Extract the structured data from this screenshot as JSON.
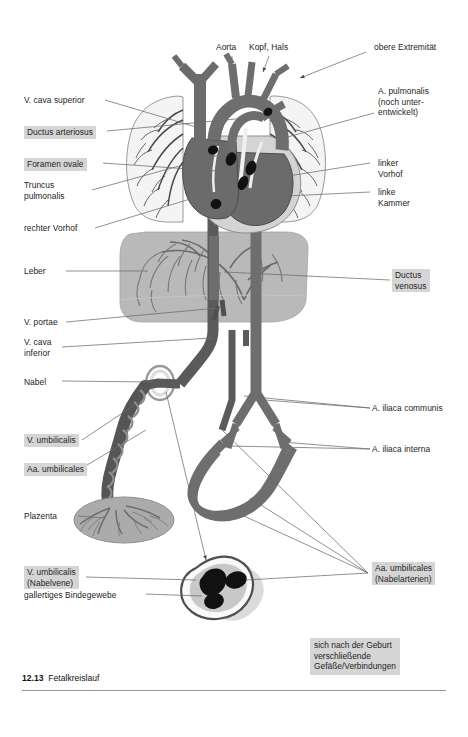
{
  "figure": {
    "caption_number": "12.13",
    "caption_title": "Fetalkreislauf",
    "title_full": "12.13  Fetalkreislauf"
  },
  "colors": {
    "page_background": "#ffffff",
    "highlight_label_background": "#d5d5d5",
    "artery_vessel": "#6e6e6e",
    "vein_vessel": "#565656",
    "organ_liver": "#b3b3b3",
    "organ_lung": "#f2f2f2",
    "placenta": "#a9a9a9",
    "occluding_marker": "#111111",
    "leader_line": "#6b6b6b",
    "caption_rule": "#9a9a9a"
  },
  "labels_top": [
    {
      "id": "aorta",
      "text": "Aorta",
      "highlight": false
    },
    {
      "id": "kopf-hals",
      "text": "Kopf, Hals",
      "highlight": false
    },
    {
      "id": "obere-extremitaet",
      "text": "obere Extremität",
      "highlight": false
    }
  ],
  "labels_left": [
    {
      "id": "v-cava-superior",
      "text": "V. cava superior",
      "highlight": false
    },
    {
      "id": "ductus-arteriosus",
      "text": "Ductus arteriosus",
      "highlight": true
    },
    {
      "id": "foramen-ovale",
      "text": "Foramen ovale",
      "highlight": true
    },
    {
      "id": "truncus-pulmonalis",
      "text": "Truncus\npulmonalis",
      "highlight": false
    },
    {
      "id": "rechter-vorhof",
      "text": "rechter Vorhof",
      "highlight": false
    },
    {
      "id": "leber",
      "text": "Leber",
      "highlight": false
    },
    {
      "id": "v-portae",
      "text": "V. portae",
      "highlight": false
    },
    {
      "id": "v-cava-inferior",
      "text": "V. cava\ninferior",
      "highlight": false
    },
    {
      "id": "nabel",
      "text": "Nabel",
      "highlight": false
    },
    {
      "id": "v-umbilicalis",
      "text": "V. umbilicalis",
      "highlight": true
    },
    {
      "id": "aa-umbilicales",
      "text": "Aa. umbilicales",
      "highlight": true
    },
    {
      "id": "plazenta",
      "text": "Plazenta",
      "highlight": false
    },
    {
      "id": "v-umbilicalis-nabelvene",
      "text": "V. umbilicalis\n(Nabelvene)",
      "highlight": true
    },
    {
      "id": "gallertiges-bindegewebe",
      "text": "gallertiges Bindegewebe",
      "highlight": false
    }
  ],
  "labels_right": [
    {
      "id": "a-pulmonalis",
      "text": "A. pulmonalis\n(noch unter-\nentwickelt)",
      "highlight": false
    },
    {
      "id": "linker-vorhof",
      "text": "linker\nVorhof",
      "highlight": false
    },
    {
      "id": "linke-kammer",
      "text": "linke\nKammer",
      "highlight": false
    },
    {
      "id": "ductus-venosus",
      "text": "Ductus\nvenosus",
      "highlight": true
    },
    {
      "id": "a-iliaca-communis",
      "text": "A. iliaca communis",
      "highlight": false
    },
    {
      "id": "a-iliaca-interna",
      "text": "A. iliaca interna",
      "highlight": false
    },
    {
      "id": "aa-umbilicales-nabelarterien",
      "text": "Aa. umbilicales\n(Nabelarterien)",
      "highlight": true
    }
  ],
  "legend_note": {
    "id": "postnatal-closure-note",
    "text": "sich nach der Geburt\nverschließende\nGefäße/Verbindungen"
  }
}
